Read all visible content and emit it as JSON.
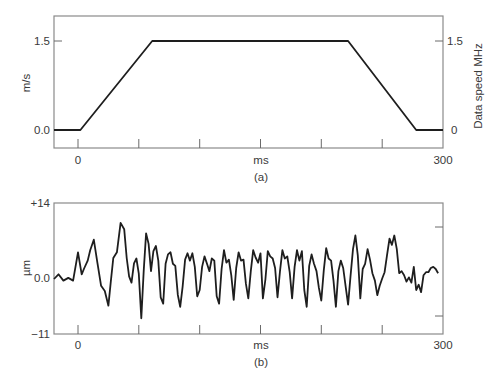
{
  "chart_data": [
    {
      "id": "a",
      "type": "line",
      "caption": "(a)",
      "xlabel": "ms",
      "ylabel": "m/s",
      "ylabel_right": "Data speed MHz",
      "x_tick_labels": [
        "0",
        "300"
      ],
      "y_tick_labels": [
        "1.5",
        "0.0"
      ],
      "y_right_tick_labels": [
        "1.5",
        "0"
      ],
      "xlim": [
        -20,
        300
      ],
      "ylim": [
        -0.3,
        1.9
      ],
      "grid": false,
      "x": [
        -20,
        2,
        61,
        222,
        278,
        300
      ],
      "values": [
        0.0,
        0.0,
        1.5,
        1.5,
        0.0,
        0.0
      ]
    },
    {
      "id": "b",
      "type": "line",
      "caption": "(b)",
      "xlabel": "ms",
      "ylabel": "µm",
      "x_tick_labels": [
        "0",
        "300"
      ],
      "y_tick_labels": [
        "+14",
        "0.0",
        "−11"
      ],
      "xlim": [
        -20,
        300
      ],
      "ylim": [
        -11,
        14
      ],
      "grid": false,
      "x": [
        -20,
        -16,
        -12,
        -8,
        -4,
        0,
        3,
        5,
        8,
        10,
        13,
        16,
        19,
        22,
        25,
        27,
        29,
        32,
        35,
        38,
        40,
        42,
        44,
        46,
        48,
        50,
        52,
        54,
        56,
        58,
        60,
        62,
        64,
        66,
        68,
        70,
        72,
        74,
        76,
        78,
        80,
        82,
        84,
        86,
        88,
        90,
        92,
        94,
        96,
        98,
        100,
        102,
        104,
        106,
        108,
        110,
        112,
        114,
        116,
        118,
        120,
        122,
        124,
        126,
        128,
        130,
        132,
        134,
        136,
        138,
        140,
        142,
        144,
        146,
        148,
        150,
        152,
        154,
        156,
        158,
        160,
        162,
        164,
        166,
        168,
        170,
        172,
        174,
        176,
        178,
        180,
        182,
        184,
        186,
        188,
        190,
        192,
        194,
        196,
        198,
        200,
        202,
        204,
        206,
        208,
        210,
        212,
        214,
        216,
        218,
        220,
        222,
        224,
        226,
        228,
        230,
        232,
        234,
        236,
        238,
        240,
        242,
        244,
        246,
        248,
        250,
        252,
        254,
        256,
        258,
        260,
        262,
        264,
        266,
        268,
        270,
        272,
        274,
        276,
        278,
        280,
        282,
        284,
        286,
        288,
        290,
        292,
        294,
        296,
        298,
        300
      ],
      "values": [
        -0.5,
        0.4,
        -0.8,
        -0.3,
        -0.8,
        4.6,
        0.4,
        1.5,
        3.0,
        5.0,
        7.0,
        2.5,
        -1.8,
        -2.8,
        -5.6,
        -1.0,
        3.5,
        4.6,
        10.2,
        9.0,
        3.5,
        0.0,
        -1.2,
        2.5,
        3.4,
        0.5,
        -8.0,
        1.0,
        8.2,
        6.2,
        1.0,
        4.8,
        5.8,
        3.0,
        -4.0,
        -5.2,
        2.4,
        4.2,
        4.6,
        2.4,
        2.0,
        -3.5,
        -5.8,
        -2.0,
        3.2,
        4.4,
        3.0,
        4.4,
        1.8,
        -3.8,
        -2.6,
        1.8,
        3.8,
        2.4,
        1.0,
        3.4,
        3.0,
        -3.8,
        -5.2,
        1.4,
        5.0,
        2.6,
        3.2,
        0.2,
        -4.5,
        1.6,
        4.6,
        3.0,
        3.2,
        -1.4,
        -4.2,
        1.0,
        5.0,
        3.6,
        2.6,
        4.4,
        -4.2,
        -0.6,
        4.8,
        3.8,
        3.4,
        1.6,
        -4.0,
        1.0,
        5.0,
        3.4,
        3.8,
        0.8,
        -4.2,
        1.8,
        5.0,
        3.0,
        4.8,
        -2.6,
        -5.8,
        2.0,
        4.2,
        2.4,
        1.0,
        -2.2,
        -4.6,
        1.2,
        5.4,
        3.4,
        3.0,
        -0.8,
        -5.8,
        1.0,
        3.0,
        1.6,
        -2.0,
        -5.4,
        0.0,
        5.2,
        7.8,
        4.0,
        -4.2,
        1.4,
        2.4,
        5.2,
        3.2,
        0.6,
        -0.8,
        -3.6,
        -1.8,
        -0.4,
        0.8,
        4.0,
        7.2,
        6.0,
        7.8,
        5.2,
        0.6,
        1.0,
        0.2,
        -1.0,
        -0.2,
        -1.2,
        1.8,
        -2.6,
        -1.6,
        -3.0,
        0.2,
        0.8,
        0.8,
        1.6,
        1.8,
        1.4,
        0.6
      ]
    }
  ]
}
